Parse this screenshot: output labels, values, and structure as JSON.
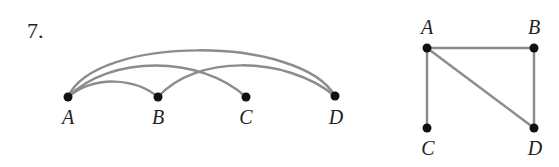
{
  "problem_number": "7.",
  "graph1": {
    "vertices": [
      {
        "id": "A",
        "x": 68,
        "y": 97
      },
      {
        "id": "B",
        "x": 158,
        "y": 97
      },
      {
        "id": "C",
        "x": 246,
        "y": 97
      },
      {
        "id": "D",
        "x": 335,
        "y": 96
      }
    ],
    "edges": [
      [
        "A",
        "B"
      ],
      [
        "A",
        "C"
      ],
      [
        "A",
        "D"
      ],
      [
        "B",
        "D"
      ]
    ]
  },
  "graph2": {
    "vertices": [
      {
        "id": "A",
        "x": 427,
        "y": 48
      },
      {
        "id": "B",
        "x": 534,
        "y": 48
      },
      {
        "id": "C",
        "x": 427,
        "y": 128
      },
      {
        "id": "D",
        "x": 534,
        "y": 128
      }
    ],
    "edges": [
      [
        "A",
        "B"
      ],
      [
        "A",
        "C"
      ],
      [
        "A",
        "D"
      ],
      [
        "B",
        "D"
      ]
    ]
  },
  "colors": {
    "edge": "#8c8c8c",
    "vertex": "#111111",
    "text": "#222222"
  }
}
